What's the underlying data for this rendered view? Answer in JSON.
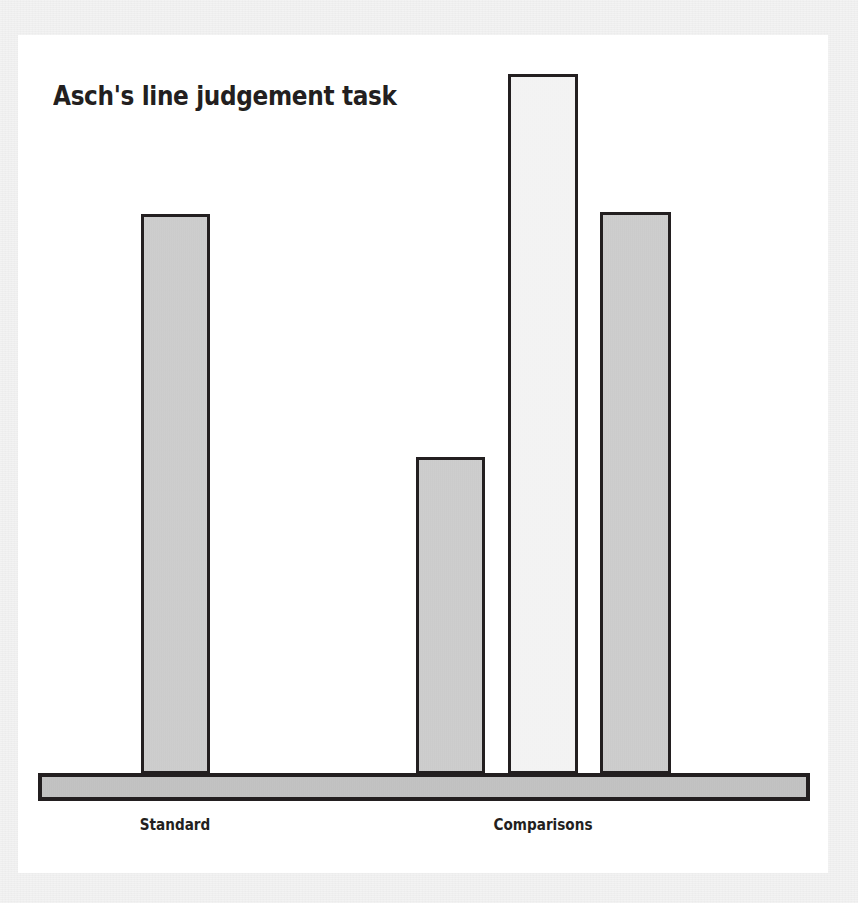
{
  "figure": {
    "title": "Asch's line judgement task",
    "background_color": "#e9e9e9",
    "card_color": "#ffffff",
    "outline_color": "#231f20"
  },
  "labels": {
    "standard": "Standard",
    "comparisons": "Comparisons"
  },
  "chart_data": {
    "type": "bar",
    "title": "Asch's line judgement task",
    "xlabel": "",
    "ylabel": "",
    "grid": false,
    "legend": "none",
    "ylim": [
      0,
      700
    ],
    "categories": [
      "Standard",
      "Comparison 1",
      "Comparison 2",
      "Comparison 3"
    ],
    "values": [
      560,
      317,
      700,
      562
    ],
    "group_labels": [
      "Standard",
      "Comparisons"
    ],
    "groups": [
      {
        "name": "Standard",
        "bars": [
          {
            "label": "Standard line",
            "value": 560,
            "fill": "#c7c7c7"
          }
        ]
      },
      {
        "name": "Comparisons",
        "bars": [
          {
            "label": "Comparison 1",
            "value": 317,
            "fill": "#c7c7c7"
          },
          {
            "label": "Comparison 2",
            "value": 700,
            "fill": "#f2f2f2"
          },
          {
            "label": "Comparison 3",
            "value": 562,
            "fill": "#c7c7c7"
          }
        ]
      }
    ],
    "baseline": {
      "label": "baseline",
      "fill": "#bcbcbc"
    },
    "annotations": []
  }
}
